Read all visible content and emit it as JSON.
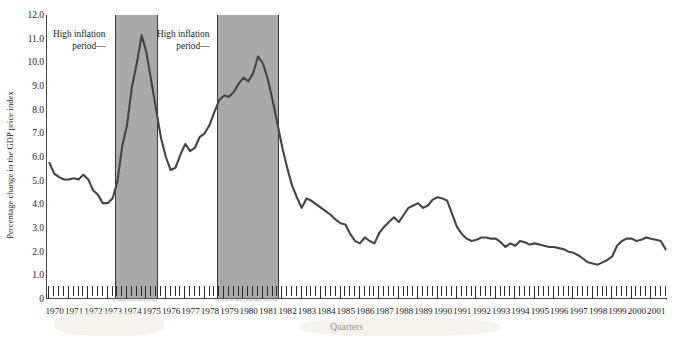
{
  "chart_data": {
    "type": "line",
    "title": "",
    "xlabel": "Quarters",
    "ylabel": "Percentage change in the GDP price index",
    "ylim": [
      0,
      12
    ],
    "ytick_labels": [
      "12.0",
      "11.0",
      "10.0",
      "9.0",
      "8.0",
      "7.0",
      "6.0",
      "5.0",
      "4.0",
      "3.0",
      "2.0",
      "1.0",
      "0"
    ],
    "ytick_values": [
      12,
      11,
      10,
      9,
      8,
      7,
      6,
      5,
      4,
      3,
      2,
      1,
      0
    ],
    "grid": false,
    "legend": "none",
    "xtick_labels": [
      "1970",
      "1971",
      "1972",
      "1973",
      "1974",
      "1975",
      "1976",
      "1977",
      "1978",
      "1979",
      "1980",
      "1981",
      "1982",
      "1983",
      "1984",
      "1985",
      "1986",
      "1987",
      "1988",
      "1989",
      "1990",
      "1991",
      "1992",
      "1993",
      "1994",
      "1995",
      "1996",
      "1997",
      "1998",
      "1999",
      "2000",
      "2001"
    ],
    "x_start_year": 1970,
    "x_end_year": 2001,
    "points_per_year": 4,
    "series": [
      {
        "name": "Percentage change in the GDP price index",
        "color": "#444444",
        "values": [
          5.75,
          5.3,
          5.15,
          5.05,
          5.05,
          5.1,
          5.05,
          5.25,
          5.05,
          4.6,
          4.4,
          4.05,
          4.05,
          4.25,
          4.95,
          6.45,
          7.35,
          8.95,
          9.95,
          11.15,
          10.4,
          9.2,
          8.0,
          6.8,
          6.0,
          5.45,
          5.55,
          6.1,
          6.55,
          6.25,
          6.4,
          6.85,
          7.0,
          7.35,
          7.9,
          8.4,
          8.6,
          8.55,
          8.75,
          9.1,
          9.35,
          9.2,
          9.55,
          10.25,
          9.95,
          9.3,
          8.4,
          7.4,
          6.4,
          5.55,
          4.8,
          4.3,
          3.85,
          4.25,
          4.15,
          4.0,
          3.85,
          3.7,
          3.55,
          3.35,
          3.2,
          3.15,
          2.75,
          2.45,
          2.35,
          2.6,
          2.45,
          2.35,
          2.8,
          3.05,
          3.25,
          3.45,
          3.25,
          3.55,
          3.85,
          3.95,
          4.05,
          3.85,
          3.95,
          4.2,
          4.3,
          4.25,
          4.15,
          3.6,
          3.05,
          2.75,
          2.55,
          2.45,
          2.5,
          2.6,
          2.6,
          2.55,
          2.55,
          2.4,
          2.2,
          2.35,
          2.25,
          2.45,
          2.4,
          2.3,
          2.35,
          2.3,
          2.25,
          2.2,
          2.2,
          2.15,
          2.1,
          2.0,
          1.95,
          1.85,
          1.7,
          1.55,
          1.5,
          1.45,
          1.55,
          1.65,
          1.8,
          2.25,
          2.45,
          2.55,
          2.55,
          2.45,
          2.5,
          2.6,
          2.55,
          2.5,
          2.45,
          2.1
        ]
      }
    ],
    "shaded_regions": [
      {
        "label": "High inflation period",
        "start_year": 1973.5,
        "end_year": 1975.7,
        "color": "#a9a9a9"
      },
      {
        "label": "High inflation period",
        "start_year": 1978.75,
        "end_year": 1981.95,
        "color": "#a9a9a9"
      }
    ],
    "annotations": [
      {
        "id": "annotation-1",
        "line1": "High inflation",
        "line2": "period—"
      },
      {
        "id": "annotation-2",
        "line1": "High inflation",
        "line2": "period—"
      }
    ]
  }
}
